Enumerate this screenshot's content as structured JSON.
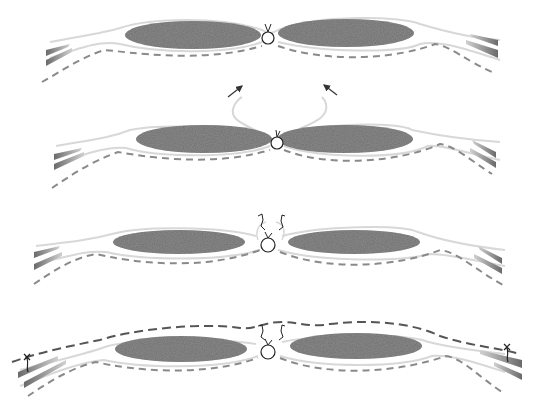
{
  "diagram": {
    "type": "surgical-illustration",
    "width": 537,
    "height": 411,
    "colors": {
      "background": "#ffffff",
      "muscle_fill": "#6e6e6e",
      "muscle_stroke": "#5a5a5a",
      "fascia_line": "#d8d8d8",
      "dashed_line": "#8a8a8a",
      "dashed_line_dark": "#555555",
      "tendon_fill": "#7a7a7a",
      "suture": "#222222",
      "arrow": "#333333"
    },
    "stages": [
      {
        "id": "stage-1",
        "label": "",
        "center_y": 35,
        "left_muscle": {
          "cx": 193,
          "cy": 35,
          "rx": 68,
          "ry": 14
        },
        "right_muscle": {
          "cx": 346,
          "cy": 33,
          "rx": 68,
          "ry": 14
        },
        "knot": {
          "cx": 268,
          "cy": 38,
          "r": 6
        },
        "arrows": [],
        "outer_dashed": false,
        "side_sutures": false
      },
      {
        "id": "stage-2",
        "label": "",
        "center_y": 138,
        "left_muscle": {
          "cx": 204,
          "cy": 139,
          "rx": 68,
          "ry": 14
        },
        "right_muscle": {
          "cx": 345,
          "cy": 139,
          "rx": 68,
          "ry": 14
        },
        "knot": {
          "cx": 277,
          "cy": 143,
          "r": 6
        },
        "arrows": [
          {
            "x1": 228,
            "y1": 97,
            "x2": 242,
            "y2": 85
          },
          {
            "x1": 337,
            "y1": 95,
            "x2": 324,
            "y2": 84
          }
        ],
        "outer_dashed": false,
        "side_sutures": false
      },
      {
        "id": "stage-3",
        "label": "",
        "center_y": 242,
        "left_muscle": {
          "cx": 179,
          "cy": 242,
          "rx": 66,
          "ry": 12
        },
        "right_muscle": {
          "cx": 354,
          "cy": 242,
          "rx": 66,
          "ry": 12
        },
        "knot": {
          "cx": 268,
          "cy": 245,
          "r": 7
        },
        "arrows": [],
        "outer_dashed": false,
        "side_sutures": false
      },
      {
        "id": "stage-4",
        "label": "",
        "center_y": 348,
        "left_muscle": {
          "cx": 181,
          "cy": 349,
          "rx": 66,
          "ry": 13
        },
        "right_muscle": {
          "cx": 356,
          "cy": 346,
          "rx": 66,
          "ry": 13
        },
        "knot": {
          "cx": 268,
          "cy": 352,
          "r": 7
        },
        "arrows": [],
        "outer_dashed": true,
        "side_sutures": true
      }
    ]
  }
}
